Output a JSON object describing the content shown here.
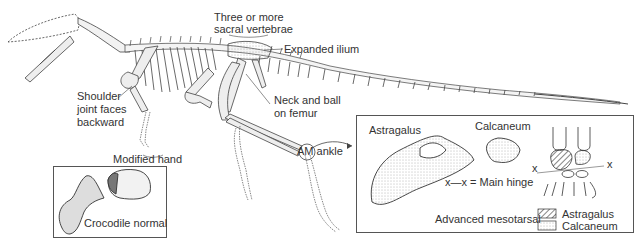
{
  "figure": {
    "labels": {
      "sacral": [
        "Three or more",
        "sacral vertebrae"
      ],
      "ilium": "Expanded ilium",
      "shoulder": [
        "Shoulder",
        "joint faces",
        "backward"
      ],
      "femur": [
        "Neck and ball",
        "on femur"
      ],
      "hand": "Modified hand",
      "ankle": "AM ankle"
    },
    "crocodile_inset": {
      "caption": "Crocodile normal"
    },
    "mesotarsal_inset": {
      "astragalus_label": "Astragalus",
      "calcaneum_label": "Calcaneum",
      "hinge_note": "x—x = Main hinge",
      "caption": "Advanced mesotarsal",
      "x_marker": "x",
      "legend": [
        {
          "pattern": "hatched",
          "label": "Astragalus"
        },
        {
          "pattern": "stippled",
          "label": "Calcaneum"
        }
      ]
    }
  }
}
